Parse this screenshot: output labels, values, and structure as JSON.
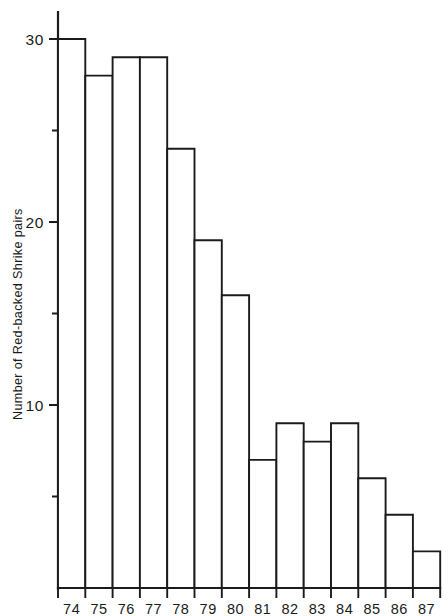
{
  "chart_data": {
    "type": "bar",
    "title": "",
    "subtitle": "",
    "xlabel": "",
    "ylabel": "Number of Red-backed Shrike pairs",
    "categories": [
      "74",
      "75",
      "76",
      "77",
      "78",
      "79",
      "80",
      "81",
      "82",
      "83",
      "84",
      "85",
      "86",
      "87"
    ],
    "values": [
      30,
      28,
      29,
      29,
      24,
      19,
      16,
      7,
      9,
      8,
      9,
      6,
      4,
      2
    ],
    "series": [
      {
        "name": "Red-backed Shrike pairs",
        "values": [
          30,
          28,
          29,
          29,
          24,
          19,
          16,
          7,
          9,
          8,
          9,
          6,
          4,
          2
        ]
      }
    ],
    "ylim": [
      0,
      31
    ],
    "y_major_ticks": [
      10,
      20,
      30
    ],
    "y_major_tick_labels": [
      "10",
      "20",
      "30"
    ],
    "y_minor_ticks": [
      5,
      15,
      25
    ],
    "grid": false,
    "legend": false,
    "legend_position": "none",
    "bar_style": "outline",
    "bar_fill": "#ffffff",
    "bar_stroke": "#1b1b1b",
    "annotations": []
  },
  "figure": {
    "background": "#ffffff",
    "ink_color": "#1b1b1b"
  },
  "axes": {
    "y_axis_title": "Number of Red-backed Shrike pairs",
    "x_axis_title": ""
  }
}
